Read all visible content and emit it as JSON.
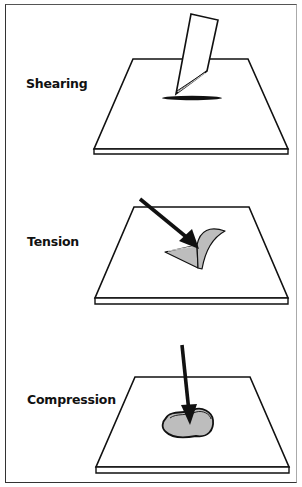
{
  "panels": [
    {
      "id": "shearing",
      "label": "Shearing"
    },
    {
      "id": "tension",
      "label": "Tension"
    },
    {
      "id": "compression",
      "label": "Compression"
    }
  ],
  "colors": {
    "stroke": "#111111",
    "fill_gray": "#bdbdbd",
    "background": "#ffffff"
  }
}
